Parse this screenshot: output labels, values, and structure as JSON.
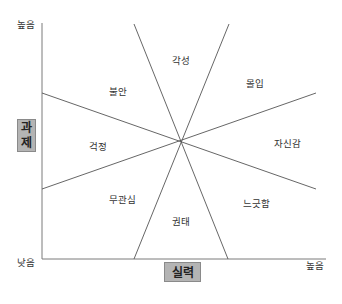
{
  "diagram": {
    "type": "flow-state-model",
    "y_axis": {
      "title_line1": "과",
      "title_line2": "제",
      "high_label": "높음",
      "low_label": "낮음"
    },
    "x_axis": {
      "title": "실력",
      "high_label": "높음"
    },
    "regions": {
      "arousal": "각성",
      "flow": "몰입",
      "anxiety": "불안",
      "worry": "걱정",
      "control": "자신감",
      "apathy": "무관심",
      "relaxation": "느긋함",
      "boredom": "권태"
    },
    "colors": {
      "line": "#555555",
      "axis": "#777777",
      "axis_title_bg": "#b4b4b4",
      "text": "#333333"
    }
  }
}
